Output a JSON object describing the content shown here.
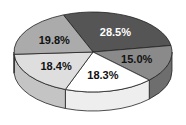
{
  "chart_data": {
    "type": "pie",
    "style": "3d",
    "title": "",
    "slices": [
      {
        "label": "28.5%",
        "value": 28.5,
        "color": "#555555",
        "side": "#3f3f3f",
        "text_color": "#ffffff"
      },
      {
        "label": "15.0%",
        "value": 15.0,
        "color": "#8a8a8a",
        "side": "#6e6e6e",
        "text_color": "#111111"
      },
      {
        "label": "18.3%",
        "value": 18.3,
        "color": "#ffffff",
        "side": "#eeeeee",
        "text_color": "#111111"
      },
      {
        "label": "18.4%",
        "value": 18.4,
        "color": "#dedede",
        "side": "#c4c4c4",
        "text_color": "#111111"
      },
      {
        "label": "19.8%",
        "value": 19.8,
        "color": "#ababab",
        "side": "#939393",
        "text_color": "#111111"
      }
    ],
    "legend": null,
    "start_angle_deg": -112
  }
}
